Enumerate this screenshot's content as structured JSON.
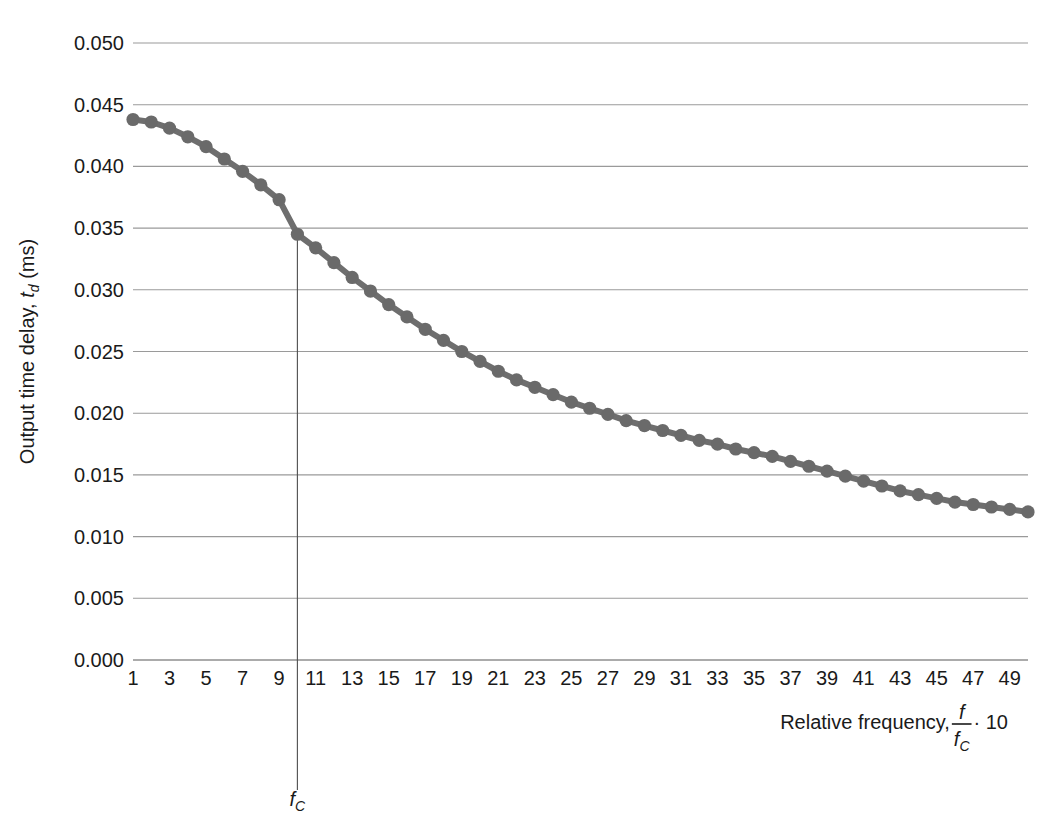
{
  "figure": {
    "background": "#ffffff",
    "series_color": "#6a6a6a",
    "grid_color": "#9a9a9a",
    "axis_color": "#8f8f8f"
  },
  "axes": {
    "y_title_prefix": "Output time delay, ",
    "y_title_var": "t",
    "y_title_sub": "d",
    "y_title_suffix": " (ms)",
    "x_title_prefix": "Relative frequency, ",
    "x_title_num": "f",
    "x_title_den_var": "f",
    "x_title_den_sub": "C",
    "x_title_suffix": " · 10"
  },
  "annotations": [
    {
      "label_var": "f",
      "label_sub": "C",
      "x_value": 10
    }
  ],
  "chart_data": {
    "type": "line",
    "title": "",
    "xlabel": "Relative frequency, f/f_C · 10",
    "ylabel": "Output time delay, t_d (ms)",
    "xlim": [
      1,
      50
    ],
    "ylim": [
      0.0,
      0.05
    ],
    "grid": true,
    "legend": null,
    "marker": "circle",
    "y_ticks": [
      "0.000",
      "0.005",
      "0.010",
      "0.015",
      "0.020",
      "0.025",
      "0.030",
      "0.035",
      "0.040",
      "0.045",
      "0.050"
    ],
    "y_tick_values": [
      0.0,
      0.005,
      0.01,
      0.015,
      0.02,
      0.025,
      0.03,
      0.035,
      0.04,
      0.045,
      0.05
    ],
    "x_ticks": [
      "1",
      "3",
      "5",
      "7",
      "9",
      "11",
      "13",
      "15",
      "17",
      "19",
      "21",
      "23",
      "25",
      "27",
      "29",
      "31",
      "33",
      "35",
      "37",
      "39",
      "41",
      "43",
      "45",
      "47",
      "49"
    ],
    "x_tick_values": [
      1,
      3,
      5,
      7,
      9,
      11,
      13,
      15,
      17,
      19,
      21,
      23,
      25,
      27,
      29,
      31,
      33,
      35,
      37,
      39,
      41,
      43,
      45,
      47,
      49
    ],
    "x": [
      1,
      2,
      3,
      4,
      5,
      6,
      7,
      8,
      9,
      10,
      11,
      12,
      13,
      14,
      15,
      16,
      17,
      18,
      19,
      20,
      21,
      22,
      23,
      24,
      25,
      26,
      27,
      28,
      29,
      30,
      31,
      32,
      33,
      34,
      35,
      36,
      37,
      38,
      39,
      40,
      41,
      42,
      43,
      44,
      45,
      46,
      47,
      48,
      49,
      50
    ],
    "values": [
      0.0438,
      0.0436,
      0.0431,
      0.0424,
      0.0416,
      0.0406,
      0.0396,
      0.0385,
      0.0373,
      0.0345,
      0.0334,
      0.0322,
      0.031,
      0.0299,
      0.0288,
      0.0278,
      0.0268,
      0.0259,
      0.025,
      0.0242,
      0.0234,
      0.0227,
      0.0221,
      0.0215,
      0.0209,
      0.0204,
      0.0199,
      0.0194,
      0.019,
      0.0186,
      0.0182,
      0.0178,
      0.0175,
      0.0171,
      0.0168,
      0.0165,
      0.0161,
      0.0157,
      0.0153,
      0.0149,
      0.0145,
      0.0141,
      0.0137,
      0.0134,
      0.0131,
      0.0128,
      0.0126,
      0.0124,
      0.0122,
      0.012
    ],
    "annotation_x": 10,
    "annotation_label": "f_C"
  }
}
